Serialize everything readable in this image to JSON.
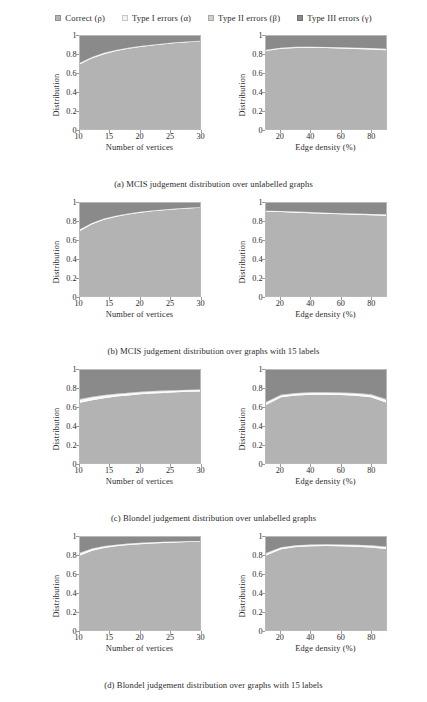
{
  "legend": {
    "entries": [
      {
        "label": "Correct (ρ)",
        "key": "correct",
        "color": "#b3b3b3"
      },
      {
        "label": "Type I errors (α)",
        "key": "type1",
        "color": "#f2f2f2"
      },
      {
        "label": "Type II errors (β)",
        "key": "type2",
        "color": "#cfcfcf"
      },
      {
        "label": "Type III errors (γ)",
        "key": "type3",
        "color": "#8a8a8a"
      }
    ]
  },
  "axes": {
    "ylabel": "Distribution",
    "yticks": [
      "0",
      "0.2",
      "0.4",
      "0.6",
      "0.8",
      "1"
    ],
    "yvalues": [
      0,
      0.2,
      0.4,
      0.6,
      0.8,
      1
    ],
    "ylim": [
      0,
      1
    ],
    "vertices": {
      "xlabel": "Number of vertices",
      "xticks": [
        "10",
        "15",
        "20",
        "25",
        "30"
      ],
      "xvalues": [
        10,
        15,
        20,
        25,
        30
      ],
      "xlim": [
        10,
        30
      ]
    },
    "density": {
      "xlabel": "Edge density (%)",
      "xticks": [
        "20",
        "40",
        "60",
        "80"
      ],
      "xvalues": [
        20,
        40,
        60,
        80
      ],
      "xlim": [
        10,
        90
      ]
    }
  },
  "captions": {
    "a": "(a) MCIS judgement distribution over unlabelled graphs",
    "b": "(b) MCIS judgement distribution over graphs with 15 labels",
    "c": "(c) Blondel judgement distribution over unlabelled graphs",
    "d": "(d) Blondel judgement distribution over graphs with 15 labels"
  },
  "chart_data": [
    {
      "id": "a-vertices",
      "type": "area",
      "stacked": true,
      "title": "MCIS judgement distribution over unlabelled graphs — by number of vertices",
      "xlabel": "Number of vertices",
      "ylabel": "Distribution",
      "xlim": [
        10,
        30
      ],
      "ylim": [
        0,
        1
      ],
      "grid": false,
      "x": [
        10,
        12,
        14,
        16,
        18,
        20,
        22,
        24,
        26,
        28,
        30
      ],
      "series": [
        {
          "name": "Correct (ρ)",
          "values": [
            0.695,
            0.76,
            0.805,
            0.838,
            0.862,
            0.882,
            0.898,
            0.912,
            0.924,
            0.934,
            0.943
          ]
        },
        {
          "name": "Type I errors (α)",
          "values": [
            0.012,
            0.01,
            0.009,
            0.008,
            0.007,
            0.006,
            0.006,
            0.005,
            0.005,
            0.004,
            0.004
          ]
        },
        {
          "name": "Type II errors (β)",
          "values": [
            0.006,
            0.005,
            0.005,
            0.004,
            0.004,
            0.004,
            0.003,
            0.003,
            0.003,
            0.003,
            0.002
          ]
        },
        {
          "name": "Type III errors (γ)",
          "values": [
            0.287,
            0.225,
            0.181,
            0.15,
            0.127,
            0.108,
            0.093,
            0.08,
            0.068,
            0.059,
            0.051
          ]
        }
      ]
    },
    {
      "id": "a-density",
      "type": "area",
      "stacked": true,
      "title": "MCIS judgement distribution over unlabelled graphs — by edge density",
      "xlabel": "Edge density (%)",
      "ylabel": "Distribution",
      "xlim": [
        10,
        90
      ],
      "ylim": [
        0,
        1
      ],
      "grid": false,
      "x": [
        10,
        20,
        30,
        40,
        50,
        60,
        70,
        80,
        90
      ],
      "series": [
        {
          "name": "Correct (ρ)",
          "values": [
            0.838,
            0.862,
            0.872,
            0.873,
            0.87,
            0.866,
            0.861,
            0.855,
            0.846
          ]
        },
        {
          "name": "Type I errors (α)",
          "values": [
            0.01,
            0.009,
            0.008,
            0.008,
            0.008,
            0.008,
            0.009,
            0.01,
            0.011
          ]
        },
        {
          "name": "Type II errors (β)",
          "values": [
            0.005,
            0.004,
            0.004,
            0.004,
            0.004,
            0.004,
            0.005,
            0.005,
            0.006
          ]
        },
        {
          "name": "Type III errors (γ)",
          "values": [
            0.147,
            0.125,
            0.116,
            0.115,
            0.118,
            0.122,
            0.125,
            0.13,
            0.137
          ]
        }
      ]
    },
    {
      "id": "b-vertices",
      "type": "area",
      "stacked": true,
      "title": "MCIS judgement distribution over graphs with 15 labels — by number of vertices",
      "xlabel": "Number of vertices",
      "ylabel": "Distribution",
      "xlim": [
        10,
        30
      ],
      "ylim": [
        0,
        1
      ],
      "grid": false,
      "x": [
        10,
        12,
        14,
        16,
        18,
        20,
        22,
        24,
        26,
        28,
        30
      ],
      "series": [
        {
          "name": "Correct (ρ)",
          "values": [
            0.7,
            0.772,
            0.82,
            0.853,
            0.877,
            0.896,
            0.911,
            0.923,
            0.933,
            0.942,
            0.95
          ]
        },
        {
          "name": "Type I errors (α)",
          "values": [
            0.011,
            0.009,
            0.008,
            0.007,
            0.006,
            0.006,
            0.005,
            0.005,
            0.004,
            0.004,
            0.003
          ]
        },
        {
          "name": "Type II errors (β)",
          "values": [
            0.006,
            0.005,
            0.004,
            0.004,
            0.004,
            0.003,
            0.003,
            0.003,
            0.003,
            0.002,
            0.002
          ]
        },
        {
          "name": "Type III errors (γ)",
          "values": [
            0.283,
            0.214,
            0.168,
            0.136,
            0.113,
            0.095,
            0.081,
            0.069,
            0.06,
            0.052,
            0.045
          ]
        }
      ]
    },
    {
      "id": "b-density",
      "type": "area",
      "stacked": true,
      "title": "MCIS judgement distribution over graphs with 15 labels — by edge density",
      "xlabel": "Edge density (%)",
      "ylabel": "Distribution",
      "xlim": [
        10,
        90
      ],
      "ylim": [
        0,
        1
      ],
      "grid": false,
      "x": [
        10,
        20,
        30,
        40,
        50,
        60,
        70,
        80,
        90
      ],
      "series": [
        {
          "name": "Correct (ρ)",
          "values": [
            0.905,
            0.902,
            0.896,
            0.89,
            0.884,
            0.879,
            0.874,
            0.869,
            0.864
          ]
        },
        {
          "name": "Type I errors (α)",
          "values": [
            0.008,
            0.008,
            0.008,
            0.008,
            0.008,
            0.008,
            0.009,
            0.009,
            0.01
          ]
        },
        {
          "name": "Type II errors (β)",
          "values": [
            0.004,
            0.004,
            0.004,
            0.004,
            0.004,
            0.004,
            0.005,
            0.005,
            0.005
          ]
        },
        {
          "name": "Type III errors (γ)",
          "values": [
            0.083,
            0.086,
            0.092,
            0.098,
            0.104,
            0.109,
            0.112,
            0.117,
            0.121
          ]
        }
      ]
    },
    {
      "id": "c-vertices",
      "type": "area",
      "stacked": true,
      "title": "Blondel judgement distribution over unlabelled graphs — by number of vertices",
      "xlabel": "Number of vertices",
      "ylabel": "Distribution",
      "xlim": [
        10,
        30
      ],
      "ylim": [
        0,
        1
      ],
      "grid": false,
      "x": [
        10,
        12,
        14,
        16,
        18,
        20,
        22,
        24,
        26,
        28,
        30
      ],
      "series": [
        {
          "name": "Correct (ρ)",
          "values": [
            0.648,
            0.676,
            0.697,
            0.714,
            0.727,
            0.738,
            0.747,
            0.754,
            0.76,
            0.765,
            0.77
          ]
        },
        {
          "name": "Type I errors (α)",
          "values": [
            0.03,
            0.027,
            0.025,
            0.023,
            0.021,
            0.02,
            0.019,
            0.018,
            0.017,
            0.016,
            0.015
          ]
        },
        {
          "name": "Type II errors (β)",
          "values": [
            0.01,
            0.009,
            0.009,
            0.008,
            0.008,
            0.007,
            0.007,
            0.007,
            0.006,
            0.006,
            0.006
          ]
        },
        {
          "name": "Type III errors (γ)",
          "values": [
            0.312,
            0.288,
            0.269,
            0.255,
            0.244,
            0.235,
            0.227,
            0.221,
            0.217,
            0.213,
            0.209
          ]
        }
      ]
    },
    {
      "id": "c-density",
      "type": "area",
      "stacked": true,
      "title": "Blondel judgement distribution over unlabelled graphs — by edge density",
      "xlabel": "Edge density (%)",
      "ylabel": "Distribution",
      "xlim": [
        10,
        90
      ],
      "ylim": [
        0,
        1
      ],
      "grid": false,
      "x": [
        10,
        20,
        30,
        40,
        50,
        60,
        70,
        80,
        90
      ],
      "series": [
        {
          "name": "Correct (ρ)",
          "values": [
            0.625,
            0.706,
            0.726,
            0.733,
            0.734,
            0.731,
            0.724,
            0.706,
            0.65
          ]
        },
        {
          "name": "Type I errors (α)",
          "values": [
            0.022,
            0.02,
            0.019,
            0.019,
            0.019,
            0.02,
            0.021,
            0.023,
            0.027
          ]
        },
        {
          "name": "Type II errors (β)",
          "values": [
            0.009,
            0.008,
            0.008,
            0.008,
            0.008,
            0.008,
            0.009,
            0.009,
            0.011
          ]
        },
        {
          "name": "Type III errors (γ)",
          "values": [
            0.344,
            0.266,
            0.247,
            0.24,
            0.239,
            0.241,
            0.246,
            0.262,
            0.312
          ]
        }
      ]
    },
    {
      "id": "d-vertices",
      "type": "area",
      "stacked": true,
      "title": "Blondel judgement distribution over graphs with 15 labels — by number of vertices",
      "xlabel": "Number of vertices",
      "ylabel": "Distribution",
      "xlim": [
        10,
        30
      ],
      "ylim": [
        0,
        1
      ],
      "grid": false,
      "x": [
        10,
        12,
        14,
        16,
        18,
        20,
        22,
        24,
        26,
        28,
        30
      ],
      "series": [
        {
          "name": "Correct (ρ)",
          "values": [
            0.8,
            0.852,
            0.881,
            0.9,
            0.913,
            0.923,
            0.93,
            0.936,
            0.941,
            0.945,
            0.948
          ]
        },
        {
          "name": "Type I errors (α)",
          "values": [
            0.022,
            0.018,
            0.015,
            0.013,
            0.012,
            0.011,
            0.01,
            0.009,
            0.008,
            0.008,
            0.007
          ]
        },
        {
          "name": "Type II errors (β)",
          "values": [
            0.008,
            0.007,
            0.006,
            0.005,
            0.005,
            0.005,
            0.004,
            0.004,
            0.004,
            0.003,
            0.003
          ]
        },
        {
          "name": "Type III errors (γ)",
          "values": [
            0.17,
            0.123,
            0.098,
            0.082,
            0.07,
            0.061,
            0.056,
            0.051,
            0.047,
            0.044,
            0.042
          ]
        }
      ]
    },
    {
      "id": "d-density",
      "type": "area",
      "stacked": true,
      "title": "Blondel judgement distribution over graphs with 15 labels — by edge density",
      "xlabel": "Edge density (%)",
      "ylabel": "Distribution",
      "xlim": [
        10,
        90
      ],
      "ylim": [
        0,
        1
      ],
      "grid": false,
      "x": [
        10,
        20,
        30,
        40,
        50,
        60,
        70,
        80,
        90
      ],
      "series": [
        {
          "name": "Correct (ρ)",
          "values": [
            0.8,
            0.868,
            0.892,
            0.901,
            0.903,
            0.901,
            0.896,
            0.888,
            0.872
          ]
        },
        {
          "name": "Type I errors (α)",
          "values": [
            0.02,
            0.016,
            0.014,
            0.013,
            0.013,
            0.013,
            0.014,
            0.015,
            0.017
          ]
        },
        {
          "name": "Type II errors (β)",
          "values": [
            0.008,
            0.007,
            0.006,
            0.006,
            0.006,
            0.006,
            0.006,
            0.007,
            0.008
          ]
        },
        {
          "name": "Type III errors (γ)",
          "values": [
            0.172,
            0.109,
            0.088,
            0.08,
            0.078,
            0.08,
            0.084,
            0.09,
            0.103
          ]
        }
      ]
    }
  ]
}
